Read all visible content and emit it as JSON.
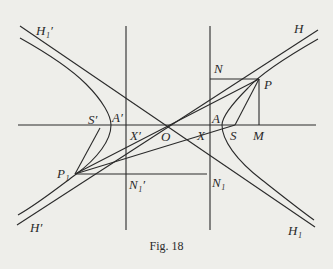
{
  "figure": {
    "caption": "Fig. 18",
    "colors": {
      "background": "#eeeeea",
      "ink": "#2a2a2a"
    }
  },
  "labels": {
    "H1_prime": "H₁′",
    "H": "H",
    "N": "N",
    "P": "P",
    "S_prime": "S′",
    "A_prime": "A′",
    "X_prime": "X′",
    "O": "O",
    "X": "X",
    "A": "A",
    "S": "S",
    "M": "M",
    "P1": "P₁",
    "N1_prime": "N₁′",
    "N1": "N₁",
    "H_prime": "H′",
    "H1": "H₁"
  },
  "geometry": {
    "center_O": [
      166,
      125
    ],
    "axis_y": 125,
    "directrix_left_x": 126,
    "directrix_right_x": 210,
    "point_P": [
      259,
      79
    ],
    "point_M": [
      259,
      125
    ],
    "point_N": [
      210,
      79
    ],
    "point_P1": [
      75,
      174
    ],
    "point_N1_prime": [
      126,
      174
    ],
    "point_N1": [
      207,
      174
    ],
    "focus_S": [
      235,
      125
    ],
    "focus_S_prime": [
      100,
      125
    ],
    "vertex_A": [
      222,
      125
    ],
    "vertex_A_prime": [
      111,
      125
    ]
  }
}
